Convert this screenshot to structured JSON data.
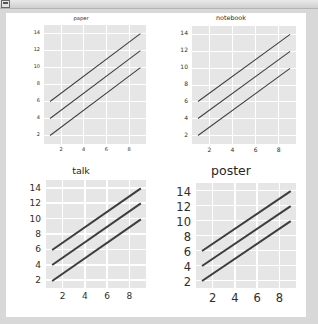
{
  "window": {
    "chrome_icon": "window-menu-icon"
  },
  "figure": {
    "background": "#ffffff",
    "page_background": "#d8d8d8",
    "panel_background": "#e6e6e6",
    "grid_color": "#ffffff",
    "line_color": "#3d3d3d"
  },
  "chart_data": [
    {
      "type": "line",
      "title": "paper",
      "context": "paper",
      "xlabel": "",
      "ylabel": "",
      "xlim": [
        0.5,
        9.5
      ],
      "ylim": [
        1.0,
        15.0
      ],
      "xticks": [
        2,
        4,
        6,
        8
      ],
      "yticks": [
        2,
        4,
        6,
        8,
        10,
        12,
        14
      ],
      "grid": true,
      "legend": "none",
      "x": [
        1,
        2,
        3,
        4,
        5,
        6,
        7,
        8,
        9
      ],
      "series": [
        {
          "name": "line-1",
          "values": [
            6,
            7,
            8,
            9,
            10,
            11,
            12,
            13,
            14
          ]
        },
        {
          "name": "line-2",
          "values": [
            4,
            5,
            6,
            7,
            8,
            9,
            10,
            11,
            12
          ]
        },
        {
          "name": "line-3",
          "values": [
            2,
            3,
            4,
            5,
            6,
            7,
            8,
            9,
            10
          ]
        }
      ]
    },
    {
      "type": "line",
      "title": "notebook",
      "context": "notebook",
      "xlabel": "",
      "ylabel": "",
      "xlim": [
        0.5,
        9.5
      ],
      "ylim": [
        1.0,
        15.0
      ],
      "xticks": [
        2,
        4,
        6,
        8
      ],
      "yticks": [
        2,
        4,
        6,
        8,
        10,
        12,
        14
      ],
      "grid": true,
      "legend": "none",
      "x": [
        1,
        2,
        3,
        4,
        5,
        6,
        7,
        8,
        9
      ],
      "series": [
        {
          "name": "line-1",
          "values": [
            6,
            7,
            8,
            9,
            10,
            11,
            12,
            13,
            14
          ]
        },
        {
          "name": "line-2",
          "values": [
            4,
            5,
            6,
            7,
            8,
            9,
            10,
            11,
            12
          ]
        },
        {
          "name": "line-3",
          "values": [
            2,
            3,
            4,
            5,
            6,
            7,
            8,
            9,
            10
          ]
        }
      ]
    },
    {
      "type": "line",
      "title": "talk",
      "context": "talk",
      "xlabel": "",
      "ylabel": "",
      "xlim": [
        0.5,
        9.5
      ],
      "ylim": [
        1.0,
        15.0
      ],
      "xticks": [
        2,
        4,
        6,
        8
      ],
      "yticks": [
        2,
        4,
        6,
        8,
        10,
        12,
        14
      ],
      "grid": true,
      "legend": "none",
      "x": [
        1,
        2,
        3,
        4,
        5,
        6,
        7,
        8,
        9
      ],
      "series": [
        {
          "name": "line-1",
          "values": [
            6,
            7,
            8,
            9,
            10,
            11,
            12,
            13,
            14
          ]
        },
        {
          "name": "line-2",
          "values": [
            4,
            5,
            6,
            7,
            8,
            9,
            10,
            11,
            12
          ]
        },
        {
          "name": "line-3",
          "values": [
            2,
            3,
            4,
            5,
            6,
            7,
            8,
            9,
            10
          ]
        }
      ]
    },
    {
      "type": "line",
      "title": "poster",
      "context": "poster",
      "xlabel": "",
      "ylabel": "",
      "xlim": [
        0.5,
        9.5
      ],
      "ylim": [
        1.0,
        15.0
      ],
      "xticks": [
        2,
        4,
        6,
        8
      ],
      "yticks": [
        2,
        4,
        6,
        8,
        10,
        12,
        14
      ],
      "grid": true,
      "legend": "none",
      "x": [
        1,
        2,
        3,
        4,
        5,
        6,
        7,
        8,
        9
      ],
      "series": [
        {
          "name": "line-1",
          "values": [
            6,
            7,
            8,
            9,
            10,
            11,
            12,
            13,
            14
          ]
        },
        {
          "name": "line-2",
          "values": [
            4,
            5,
            6,
            7,
            8,
            9,
            10,
            11,
            12
          ]
        },
        {
          "name": "line-3",
          "values": [
            2,
            3,
            4,
            5,
            6,
            7,
            8,
            9,
            10
          ]
        }
      ]
    }
  ]
}
